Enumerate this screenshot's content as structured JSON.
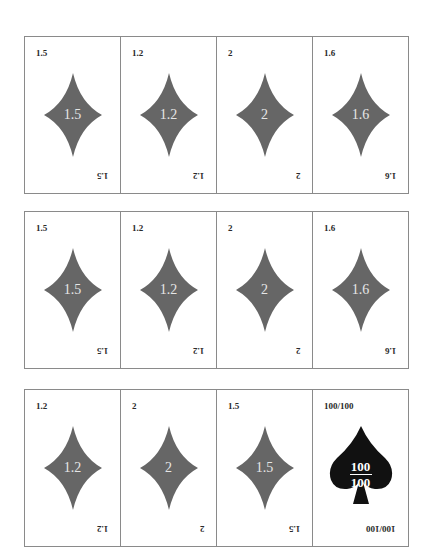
{
  "colors": {
    "diamond": "#666666",
    "spade": "#111111",
    "border": "#8a8a8a"
  },
  "rows": [
    {
      "cards": [
        {
          "value": "1.5",
          "suit": "diamond"
        },
        {
          "value": "1.2",
          "suit": "diamond"
        },
        {
          "value": "2",
          "suit": "diamond"
        },
        {
          "value": "1.6",
          "suit": "diamond"
        }
      ]
    },
    {
      "cards": [
        {
          "value": "1.5",
          "suit": "diamond"
        },
        {
          "value": "1.2",
          "suit": "diamond"
        },
        {
          "value": "2",
          "suit": "diamond"
        },
        {
          "value": "1.6",
          "suit": "diamond"
        }
      ]
    },
    {
      "cards": [
        {
          "value": "1.2",
          "suit": "diamond"
        },
        {
          "value": "2",
          "suit": "diamond"
        },
        {
          "value": "1.5",
          "suit": "diamond"
        },
        {
          "value": "100/100",
          "suit": "spade",
          "numerator": "100",
          "denominator": "100"
        }
      ]
    }
  ]
}
